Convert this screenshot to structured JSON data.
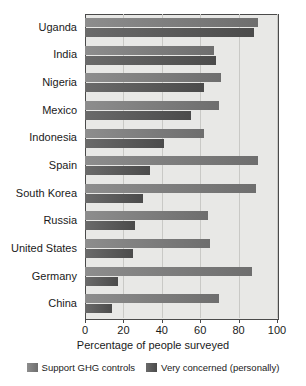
{
  "chart_data": {
    "type": "bar",
    "orientation": "horizontal",
    "title": "",
    "xlabel": "Percentage of people surveyed",
    "ylabel": "",
    "xlim": [
      0,
      100
    ],
    "xticks": [
      0,
      20,
      40,
      60,
      80,
      100
    ],
    "grid": true,
    "legend_position": "bottom",
    "categories": [
      "Uganda",
      "India",
      "Nigeria",
      "Mexico",
      "Indonesia",
      "Spain",
      "South Korea",
      "Russia",
      "United States",
      "Germany",
      "China"
    ],
    "series": [
      {
        "name": "Support GHG controls",
        "color": "#7c7c7c",
        "values": [
          90,
          67,
          71,
          70,
          62,
          90,
          89,
          64,
          65,
          87,
          70
        ]
      },
      {
        "name": "Very concerned (personally)",
        "color": "#565656",
        "values": [
          88,
          68,
          62,
          55,
          41,
          34,
          30,
          26,
          25,
          17,
          14
        ]
      }
    ]
  },
  "colors": {
    "plot_background": "#e8e8e6",
    "axis": "#4a4a4a",
    "gridline": "#c9c9c6",
    "text": "#1a1a1a"
  }
}
